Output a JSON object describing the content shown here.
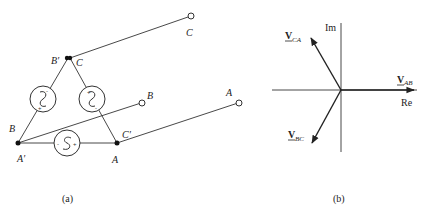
{
  "figure": {
    "panel_a": {
      "caption": "(a)",
      "node_labels": {
        "top_left": "B′",
        "top_right": "C",
        "left_top": "B",
        "left_bottom": "A′",
        "right_top": "C′",
        "right_bottom": "A"
      },
      "terminal_labels": {
        "C": "C",
        "B": "B",
        "A": "A"
      },
      "sources": [
        {
          "name": "source-BA-left",
          "polarity": [
            "+",
            "-"
          ]
        },
        {
          "name": "source-CB-right",
          "polarity": [
            "+",
            "-"
          ]
        },
        {
          "name": "source-AB-bottom",
          "polarity": [
            "-",
            "+"
          ]
        }
      ],
      "plus_sign": "+",
      "minus_sign": "−"
    },
    "panel_b": {
      "caption": "(b)",
      "axis_im": "Im",
      "axis_re": "Re",
      "phasors": [
        {
          "name": "V_AB",
          "main": "V",
          "sub": "AB",
          "angle_deg": 0
        },
        {
          "name": "V_CA",
          "main": "V",
          "sub": "CA",
          "angle_deg": 120
        },
        {
          "name": "V_BC",
          "main": "V",
          "sub": "BC",
          "angle_deg": -120
        }
      ]
    }
  }
}
